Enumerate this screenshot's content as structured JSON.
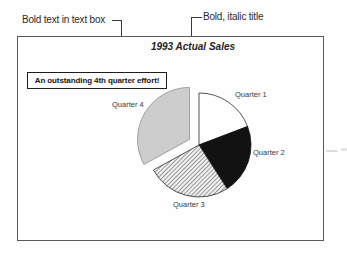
{
  "figure": {
    "callouts": [
      {
        "label": "Bold text in text box"
      },
      {
        "label": "Bold, italic title"
      }
    ],
    "title": "1993 Actual Sales",
    "textbox": "An outstanding 4th quarter effort!"
  },
  "chart_data": {
    "type": "pie",
    "title": "1993 Actual Sales",
    "categories": [
      "Quarter 1",
      "Quarter 2",
      "Quarter 3",
      "Quarter 4"
    ],
    "values": [
      19.2,
      21.7,
      26.1,
      33.0
    ],
    "start_angle_deg": 0,
    "exploded_slice": "Quarter 4",
    "explode_offset_px": 11,
    "slice_styles": [
      "white",
      "black",
      "diagonal-hatch",
      "light-gray"
    ],
    "legend": "none",
    "annotation": "An outstanding 4th quarter effort!"
  },
  "colors": {
    "black_slice": "#121212",
    "light_gray_slice": "#cdcdcd",
    "hatch_line": "#4a4a4a",
    "outline": "#2a2a2a",
    "frame_border": "#5a5a5a",
    "callout_line": "#3a3a3a"
  }
}
